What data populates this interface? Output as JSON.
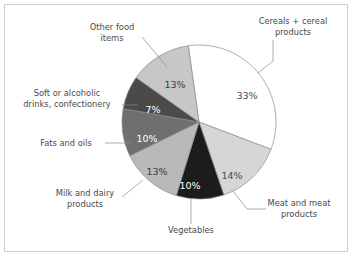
{
  "figure": {
    "background_color": "#ffffff",
    "border_color": "#cfcfcf",
    "outline_color": "#8d8d8d"
  },
  "chart_data": {
    "type": "pie",
    "title": "",
    "subtitle": "",
    "xlabel": "",
    "ylabel": "",
    "legend_position": "none",
    "grid": false,
    "start_angle_deg": -8,
    "direction": "clockwise",
    "center": {
      "x": 199,
      "y": 122
    },
    "radius": 77,
    "categories": [
      "Cereals + cereal products",
      "Meat and meat products",
      "Vegetables",
      "Milk and dairy products",
      "Fats and oils",
      "Soft or alcoholic drinks, confectionery",
      "Other food items"
    ],
    "values": [
      33,
      14,
      10,
      13,
      10,
      7,
      13
    ],
    "value_labels": [
      "33%",
      "14%",
      "10%",
      "13%",
      "10%",
      "7%",
      "13%"
    ],
    "colors": [
      "#ffffff",
      "#d6d6d6",
      "#1c1c1c",
      "#b9b9b9",
      "#6f6f6f",
      "#4a4a4a",
      "#c7c7c7"
    ],
    "label_text_colors": [
      "#4a4a4a",
      "#4a4a4a",
      "#ffffff",
      "#3a3a3a",
      "#ffffff",
      "#ffffff",
      "#3a3a3a"
    ],
    "slices": [
      {
        "name": "Cereals + cereal products",
        "label": "Cereals + cereal products",
        "label_lines": [
          "Cereals + cereal",
          "products"
        ],
        "percent": 33,
        "value_label": "33%",
        "color": "#ffffff",
        "pct_label_pos": {
          "x": 247,
          "y": 96
        },
        "text_pos": {
          "x": 293,
          "y": 24
        },
        "leader": "M 273 40 L 273 61 L 258 73"
      },
      {
        "name": "Meat and meat products",
        "label": "Meat and meat products",
        "label_lines": [
          "Meat and meat",
          "products"
        ],
        "percent": 14,
        "value_label": "14%",
        "color": "#d6d6d6",
        "pct_label_pos": {
          "x": 232,
          "y": 176
        },
        "text_pos": {
          "x": 299,
          "y": 206
        },
        "leader": "M 266 209 L 247 209 L 233 191"
      },
      {
        "name": "Vegetables",
        "label": "Vegetables",
        "label_lines": [
          "Vegetables"
        ],
        "percent": 10,
        "value_label": "10%",
        "color": "#1c1c1c",
        "pct_label_pos": {
          "x": 190,
          "y": 186
        },
        "text_pos": {
          "x": 191,
          "y": 233
        },
        "leader": "M 191 199 L 191 224"
      },
      {
        "name": "Milk and dairy products",
        "label": "Milk and dairy products",
        "label_lines": [
          "Milk and dairy",
          "products"
        ],
        "percent": 13,
        "value_label": "13%",
        "color": "#b9b9b9",
        "pct_label_pos": {
          "x": 157,
          "y": 172
        },
        "text_pos": {
          "x": 85,
          "y": 196
        },
        "leader": "M 122 197 L 143 180"
      },
      {
        "name": "Fats and oils",
        "label": "Fats and oils",
        "label_lines": [
          "Fats and oils"
        ],
        "percent": 10,
        "value_label": "10%",
        "color": "#6f6f6f",
        "pct_label_pos": {
          "x": 147,
          "y": 139
        },
        "text_pos": {
          "x": 66,
          "y": 146
        },
        "leader": "M 105 143 L 131 143"
      },
      {
        "name": "Soft or alcoholic drinks, confectionery",
        "label": "Soft or alcoholic drinks, confectionery",
        "label_lines": [
          "Soft or alcoholic",
          "drinks, confectionery"
        ],
        "percent": 7,
        "value_label": "7%",
        "color": "#4a4a4a",
        "pct_label_pos": {
          "x": 153,
          "y": 110
        },
        "text_pos": {
          "x": 67,
          "y": 96
        },
        "leader": "M 122 105 L 138 105"
      },
      {
        "name": "Other food items",
        "label": "Other food items",
        "label_lines": [
          "Other food",
          "items"
        ],
        "percent": 13,
        "value_label": "13%",
        "color": "#c7c7c7",
        "pct_label_pos": {
          "x": 175,
          "y": 85
        },
        "text_pos": {
          "x": 112,
          "y": 30
        },
        "leader": "M 142 37 L 167 67"
      }
    ]
  }
}
